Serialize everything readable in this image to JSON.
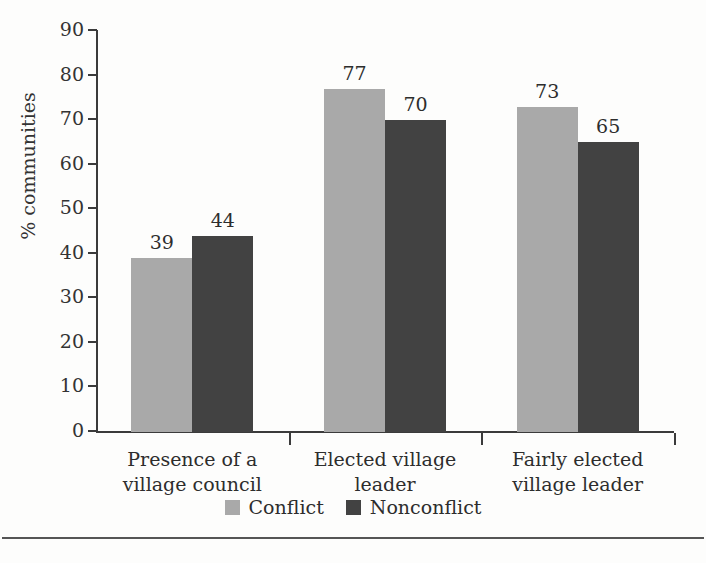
{
  "chart_data": {
    "type": "bar",
    "title": "",
    "xlabel": "",
    "ylabel": "% communities",
    "ylim": [
      0,
      90
    ],
    "ytick_step": 10,
    "yticks": [
      90,
      80,
      70,
      60,
      50,
      40,
      30,
      20,
      10,
      0
    ],
    "grid": false,
    "legend_position": "bottom-center",
    "categories": [
      "Presence of a village council",
      "Elected village leader",
      "Fairly elected village leader"
    ],
    "category_lines": [
      [
        "Presence of a",
        "village council"
      ],
      [
        "Elected village",
        "leader"
      ],
      [
        "Fairly elected",
        "village leader"
      ]
    ],
    "series": [
      {
        "name": "Conflict",
        "color": "#a9a9a9",
        "values": [
          39,
          77,
          73
        ]
      },
      {
        "name": "Nonconflict",
        "color": "#424242",
        "values": [
          44,
          70,
          65
        ]
      }
    ]
  },
  "legend": {
    "items": [
      {
        "label": "Conflict",
        "color": "#a9a9a9"
      },
      {
        "label": "Nonconflict",
        "color": "#424242"
      }
    ]
  },
  "axis": {
    "y_title": "% communities"
  }
}
